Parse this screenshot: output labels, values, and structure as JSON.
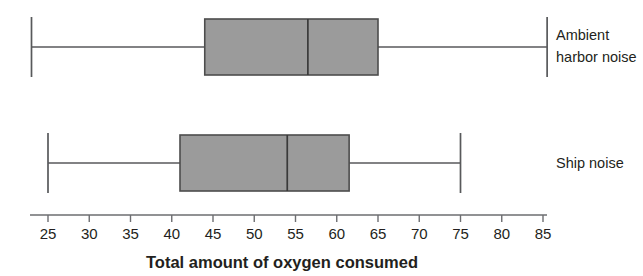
{
  "chart_data": {
    "type": "box",
    "title": "",
    "xlabel": "Total amount of oxygen consumed",
    "ylabel": "",
    "orientation": "horizontal",
    "xlim": [
      22,
      87
    ],
    "grid": false,
    "legend": "none",
    "axis": {
      "ticks": [
        25,
        30,
        35,
        40,
        45,
        50,
        55,
        60,
        65,
        70,
        75,
        80,
        85
      ],
      "tick_labels": [
        "25",
        "30",
        "35",
        "40",
        "45",
        "50",
        "55",
        "60",
        "65",
        "70",
        "75",
        "80",
        "85"
      ],
      "min": 25,
      "max": 85,
      "step": 5
    },
    "categories": [
      "Ambient harbor noise",
      "Ship noise"
    ],
    "boxes": [
      {
        "label": "Ambient harbor noise",
        "label_lines": [
          "Ambient",
          "harbor noise"
        ],
        "min": 23,
        "q1": 44,
        "median": 56.5,
        "q3": 65,
        "max": 85.5
      },
      {
        "label": "Ship noise",
        "label_lines": [
          "Ship noise"
        ],
        "min": 25,
        "q1": 41,
        "median": 54,
        "q3": 61.5,
        "max": 75
      }
    ],
    "colors": {
      "box_fill": "#9b9b9b",
      "box_stroke": "#4d4d4d",
      "whisker": "#58595b",
      "axis": "#6d6e71",
      "text": "#231f20",
      "background": "#ffffff"
    }
  }
}
